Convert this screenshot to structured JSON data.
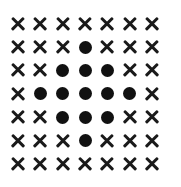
{
  "grid": {
    "rows": 7,
    "cols": 7,
    "symbols": {
      "x": "cross-mark",
      "o": "filled-dot"
    },
    "cells": [
      [
        "x",
        "x",
        "x",
        "x",
        "x",
        "x",
        "x"
      ],
      [
        "x",
        "x",
        "x",
        "o",
        "x",
        "x",
        "x"
      ],
      [
        "x",
        "x",
        "o",
        "o",
        "o",
        "x",
        "x"
      ],
      [
        "x",
        "o",
        "o",
        "o",
        "o",
        "o",
        "x"
      ],
      [
        "x",
        "x",
        "o",
        "o",
        "o",
        "x",
        "x"
      ],
      [
        "x",
        "x",
        "x",
        "o",
        "x",
        "x",
        "x"
      ],
      [
        "x",
        "x",
        "x",
        "x",
        "x",
        "x",
        "x"
      ]
    ],
    "colors": {
      "mark": "#111111",
      "background": "#ffffff"
    }
  }
}
